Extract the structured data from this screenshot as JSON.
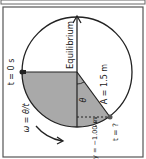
{
  "diagram": {
    "orientation": "rotated-90-clockwise",
    "labels": {
      "t0": "t = 0 s",
      "equilibrium": "Equilibrium",
      "amplitude": "A = 1.5 m",
      "theta": "θ",
      "t_unknown": "t = ?",
      "y_value": "y = −1.00 m",
      "omega": "ω = θ/t"
    },
    "colors": {
      "shade": "#a9a9a9",
      "stroke": "#222222",
      "frame": "#555555"
    }
  }
}
